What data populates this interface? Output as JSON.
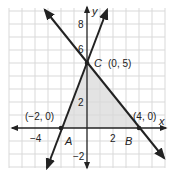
{
  "diagram": {
    "type": "coordinate-plane-triangle",
    "axes": {
      "x_label": "x",
      "y_label": "y",
      "x_tick_labels": [
        "−4",
        "2"
      ],
      "y_tick_labels": [
        "8",
        "6",
        "2",
        "−2"
      ],
      "x_range": [
        -6,
        6
      ],
      "y_range": [
        -3,
        9
      ],
      "grid": true
    },
    "points": [
      {
        "name": "A",
        "coords_label": "(−2, 0)",
        "x": -2,
        "y": 0
      },
      {
        "name": "B",
        "coords_label": "(4, 0)",
        "x": 4,
        "y": 0
      },
      {
        "name": "C",
        "coords_label": "(0, 5)",
        "x": 0,
        "y": 5
      }
    ],
    "lines": [
      {
        "name": "line-AC",
        "through": [
          "A",
          "C"
        ]
      },
      {
        "name": "line-BC",
        "through": [
          "B",
          "C"
        ]
      }
    ],
    "shaded_region": "triangle ABC",
    "colors": {
      "grid": "#d9d9d9",
      "shade": "#e3e3e3",
      "line": "#222222",
      "axis": "#222222"
    }
  }
}
